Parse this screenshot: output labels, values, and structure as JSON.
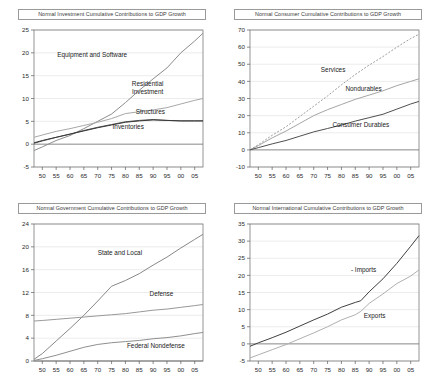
{
  "figure": {
    "panels": [
      {
        "id": "investment",
        "position": "top-left",
        "title": "Normal Investment Cumulative Contributions to GDP Growth"
      },
      {
        "id": "consumer",
        "position": "top-right",
        "title": "Normal Consumer Cumulative Contributions to GDP Growth"
      },
      {
        "id": "government",
        "position": "bottom-left",
        "title": "Normal Government Cumulative Contributions to GDP Growth"
      },
      {
        "id": "international",
        "position": "bottom-right",
        "title": "Normal International Cumulative Contributions to GDP Growth"
      }
    ]
  },
  "chart_data": [
    {
      "type": "line",
      "title": "Normal Investment Cumulative Contributions to GDP Growth",
      "xlabel": "",
      "ylabel": "",
      "xlim": [
        1947,
        2008
      ],
      "ylim": [
        -5,
        25
      ],
      "yticks": [
        -5,
        0,
        5,
        10,
        15,
        20,
        25
      ],
      "xticks": [
        1950,
        1955,
        1960,
        1965,
        1970,
        1975,
        1980,
        1985,
        1990,
        1995,
        2000,
        2005
      ],
      "xticklabels": [
        "50",
        "55",
        "60",
        "65",
        "70",
        "75",
        "80",
        "85",
        "90",
        "95",
        "00",
        "05"
      ],
      "grid": true,
      "legend": "inline-annotations",
      "x": [
        1947,
        1950,
        1955,
        1960,
        1965,
        1970,
        1975,
        1980,
        1985,
        1990,
        1995,
        2000,
        2005,
        2008
      ],
      "series": [
        {
          "name": "Equipment and Software",
          "color": "#8c8c8c",
          "values": [
            -1.4,
            -0.6,
            0.8,
            1.9,
            3.4,
            5.0,
            6.6,
            9.1,
            11.8,
            14.3,
            16.7,
            20.0,
            22.6,
            24.3
          ],
          "label_x": 1968,
          "label_y": 19.0
        },
        {
          "name": "Residential Investment",
          "color": "#a8a8a8",
          "values": [
            1.5,
            2.0,
            2.8,
            3.4,
            4.1,
            4.8,
            5.6,
            6.7,
            7.1,
            7.5,
            8.0,
            8.8,
            9.6,
            10.0
          ],
          "label_x": 1988,
          "label_y": 12.8
        },
        {
          "name": "Structures",
          "color": "#5a5a5a",
          "values": [
            0.2,
            0.7,
            1.5,
            2.2,
            3.0,
            3.7,
            4.3,
            4.9,
            5.2,
            5.4,
            5.2,
            5.1,
            5.1,
            5.1
          ],
          "label_x": 1989,
          "label_y": 6.6
        },
        {
          "name": "Inventories",
          "color": "#3a3a3a",
          "values": [
            0.3,
            0.8,
            1.5,
            2.2,
            2.9,
            3.6,
            4.2,
            4.8,
            5.1,
            5.3,
            5.2,
            5.1,
            5.1,
            5.1
          ],
          "label_x": 1981,
          "label_y": 3.4
        }
      ]
    },
    {
      "type": "line",
      "title": "Normal Consumer Cumulative Contributions to GDP Growth",
      "xlabel": "",
      "ylabel": "",
      "xlim": [
        1947,
        2008
      ],
      "ylim": [
        -10,
        70
      ],
      "yticks": [
        -10,
        0,
        10,
        20,
        30,
        40,
        50,
        60,
        70
      ],
      "xticks": [
        1950,
        1955,
        1960,
        1965,
        1970,
        1975,
        1980,
        1985,
        1990,
        1995,
        2000,
        2005
      ],
      "xticklabels": [
        "50",
        "55",
        "60",
        "65",
        "70",
        "75",
        "80",
        "85",
        "90",
        "95",
        "00",
        "05"
      ],
      "grid": true,
      "legend": "inline-annotations",
      "x": [
        1947,
        1950,
        1955,
        1960,
        1965,
        1970,
        1975,
        1980,
        1985,
        1990,
        1995,
        2000,
        2005,
        2008
      ],
      "series": [
        {
          "name": "Services",
          "color": "#9e9e9e",
          "style": "dashed",
          "values": [
            0.0,
            3.0,
            8.5,
            13.5,
            19.5,
            25.5,
            31.5,
            38.0,
            44.0,
            49.5,
            54.5,
            60.0,
            65.0,
            67.5
          ],
          "label_x": 1977,
          "label_y": 45.5
        },
        {
          "name": "Nondurables",
          "color": "#a5a5a5",
          "values": [
            0.0,
            2.5,
            7.0,
            11.0,
            15.5,
            20.0,
            23.5,
            26.5,
            29.5,
            32.0,
            34.5,
            37.5,
            40.0,
            41.5
          ],
          "label_x": 1988,
          "label_y": 34.5
        },
        {
          "name": "Consumer Durables",
          "color": "#4f4f4f",
          "values": [
            0.0,
            1.3,
            3.5,
            5.5,
            8.0,
            10.5,
            12.5,
            14.5,
            16.8,
            18.8,
            20.8,
            23.8,
            26.8,
            28.3
          ],
          "label_x": 1987,
          "label_y": 13.5
        }
      ]
    },
    {
      "type": "line",
      "title": "Normal Government Cumulative Contributions to GDP Growth",
      "xlabel": "",
      "ylabel": "",
      "xlim": [
        1947,
        2008
      ],
      "ylim": [
        0,
        24
      ],
      "yticks": [
        0,
        4,
        8,
        12,
        16,
        20,
        24
      ],
      "xticks": [
        1950,
        1955,
        1960,
        1965,
        1970,
        1975,
        1980,
        1985,
        1990,
        1995,
        2000,
        2005
      ],
      "xticklabels": [
        "50",
        "55",
        "60",
        "65",
        "70",
        "75",
        "80",
        "85",
        "90",
        "95",
        "00",
        "05"
      ],
      "grid": true,
      "legend": "inline-annotations",
      "x": [
        1947,
        1950,
        1955,
        1960,
        1965,
        1970,
        1975,
        1980,
        1985,
        1990,
        1995,
        2000,
        2005,
        2008
      ],
      "series": [
        {
          "name": "State and Local",
          "color": "#888888",
          "values": [
            0.3,
            1.3,
            3.5,
            5.7,
            8.0,
            10.5,
            13.1,
            14.1,
            15.3,
            16.8,
            18.2,
            19.8,
            21.3,
            22.2
          ],
          "label_x": 1978,
          "label_y": 18.6
        },
        {
          "name": "Defense",
          "color": "#999999",
          "values": [
            7.0,
            7.1,
            7.3,
            7.5,
            7.7,
            7.9,
            8.1,
            8.3,
            8.6,
            8.9,
            9.1,
            9.4,
            9.7,
            9.9
          ],
          "label_x": 1993,
          "label_y": 11.4
        },
        {
          "name": "Federal Nondefense",
          "color": "#8f8f8f",
          "values": [
            0.1,
            0.4,
            1.0,
            1.7,
            2.4,
            2.9,
            3.2,
            3.4,
            3.6,
            3.9,
            4.1,
            4.4,
            4.8,
            5.0
          ],
          "label_x": 1991,
          "label_y": 2.3
        }
      ]
    },
    {
      "type": "line",
      "title": "Normal International Cumulative Contributions to GDP Growth",
      "xlabel": "",
      "ylabel": "",
      "xlim": [
        1947,
        2008
      ],
      "ylim": [
        -5,
        35
      ],
      "yticks": [
        -5,
        0,
        5,
        10,
        15,
        20,
        25,
        30,
        35
      ],
      "xticks": [
        1950,
        1955,
        1960,
        1965,
        1970,
        1975,
        1980,
        1985,
        1990,
        1995,
        2000,
        2005
      ],
      "xticklabels": [
        "50",
        "55",
        "60",
        "65",
        "70",
        "75",
        "80",
        "85",
        "90",
        "95",
        "00",
        "05"
      ],
      "grid": true,
      "legend": "inline-annotations",
      "x": [
        1947,
        1950,
        1955,
        1960,
        1965,
        1970,
        1975,
        1980,
        1985,
        1987,
        1990,
        1995,
        2000,
        2005,
        2008
      ],
      "series": [
        {
          "name": "- Imports",
          "color": "#3f3f3f",
          "values": [
            -0.7,
            0.3,
            1.8,
            3.4,
            5.2,
            7.0,
            8.7,
            10.7,
            12.1,
            12.6,
            15.2,
            19.0,
            23.5,
            28.5,
            31.6
          ],
          "label_x": 1988,
          "label_y": 21.0
        },
        {
          "name": "Exports",
          "color": "#b0b0b0",
          "values": [
            -4.1,
            -3.2,
            -1.7,
            -0.2,
            1.5,
            3.2,
            5.0,
            7.0,
            8.5,
            9.5,
            11.8,
            14.6,
            17.6,
            19.8,
            21.6
          ],
          "label_x": 1992,
          "label_y": 7.5
        }
      ]
    }
  ]
}
